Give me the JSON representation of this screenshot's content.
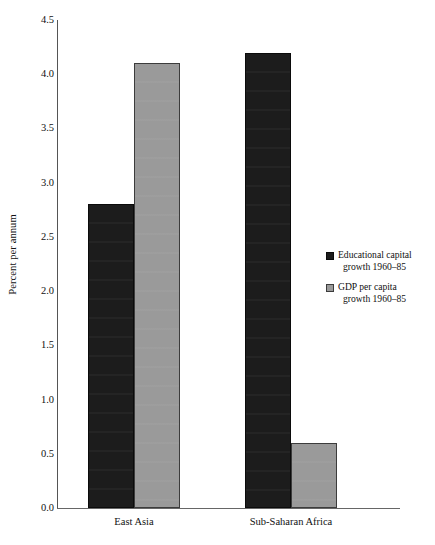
{
  "chart_data": {
    "type": "bar",
    "title": "",
    "xlabel": "",
    "ylabel": "Percent per annum",
    "ylim": [
      0.0,
      4.5
    ],
    "ytick_step": 0.5,
    "ytick_labels": [
      "4.5",
      "4.0",
      "3.5",
      "3.0",
      "2.5",
      "2.0",
      "1.5",
      "1.0",
      "0.5",
      "0.0"
    ],
    "ytick_values": [
      4.5,
      4.0,
      3.5,
      3.0,
      2.5,
      2.0,
      1.5,
      1.0,
      0.5,
      0.0
    ],
    "grid": false,
    "legend_position": "right",
    "categories": [
      "East Asia",
      "Sub-Saharan Africa"
    ],
    "series": [
      {
        "name": "Educational capital growth 1960–85",
        "name_line1": "Educational capital",
        "name_line2": "growth 1960–85",
        "color": "#1c1c1c",
        "values": [
          2.8,
          4.2
        ]
      },
      {
        "name": "GDP per capita growth 1960–85",
        "name_line1": "GDP per capita",
        "name_line2": "growth 1960–85",
        "color": "#9a9a9a",
        "values": [
          4.1,
          0.6
        ]
      }
    ]
  },
  "colors": {
    "series_dark": "#1c1c1c",
    "series_gray": "#9a9a9a",
    "axis": "#555555",
    "text": "#111111",
    "background": "#ffffff"
  }
}
